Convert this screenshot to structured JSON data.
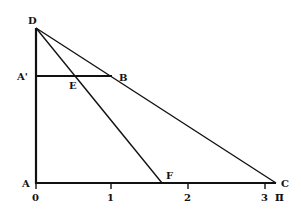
{
  "diagram": {
    "points": {
      "D": {
        "label": "D"
      },
      "A_prime": {
        "label": "A'"
      },
      "B": {
        "label": "B"
      },
      "E": {
        "label": "E"
      },
      "A": {
        "label": "A"
      },
      "F": {
        "label": "F"
      },
      "C": {
        "label": "C"
      }
    },
    "x_axis": {
      "ticks": [
        "0",
        "1",
        "2",
        "3"
      ],
      "pi_label": "π"
    },
    "colors": {
      "line": "#111111",
      "background": "#ffffff"
    }
  }
}
